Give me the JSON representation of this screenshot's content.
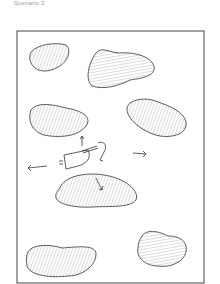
{
  "caption": "Scenario 2",
  "sketch": {
    "description": "Hand-drawn top-down sketch of a boat among rock islands with movement arrows",
    "ink_color": "#333333",
    "hatch_color": "#8a8a8a",
    "islands": [
      {
        "name": "island-top-left"
      },
      {
        "name": "island-top-right"
      },
      {
        "name": "island-middle-left"
      },
      {
        "name": "island-middle-right"
      },
      {
        "name": "island-center-bottom"
      },
      {
        "name": "island-bottom-left"
      },
      {
        "name": "island-bottom-right"
      }
    ],
    "arrows": [
      "up",
      "left",
      "right",
      "down"
    ]
  }
}
